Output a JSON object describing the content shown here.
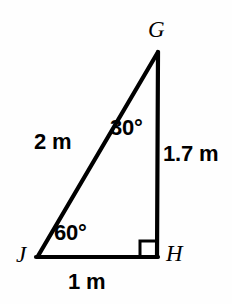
{
  "figure": {
    "type": "right-triangle-geometry-diagram",
    "background_color": "#fefefe",
    "stroke_color": "#000000",
    "vertices": [
      {
        "name": "G",
        "label": "G",
        "x": 158,
        "y": 52
      },
      {
        "name": "H",
        "label": "H",
        "x": 157,
        "y": 256
      },
      {
        "name": "J",
        "label": "J",
        "x": 38,
        "y": 256
      }
    ],
    "sides": [
      {
        "name": "JG",
        "label": "2 m",
        "value": 2,
        "unit": "m"
      },
      {
        "name": "GH",
        "label": "1.7 m",
        "value": 1.7,
        "unit": "m"
      },
      {
        "name": "JH",
        "label": "1 m",
        "value": 1,
        "unit": "m"
      }
    ],
    "angles": [
      {
        "vertex": "G",
        "label": "30°",
        "value": 30,
        "unit": "degrees"
      },
      {
        "vertex": "J",
        "label": "60°",
        "value": 60,
        "unit": "degrees"
      },
      {
        "vertex": "H",
        "label": "",
        "value": 90,
        "unit": "degrees",
        "marker": "right-angle-square"
      }
    ]
  }
}
